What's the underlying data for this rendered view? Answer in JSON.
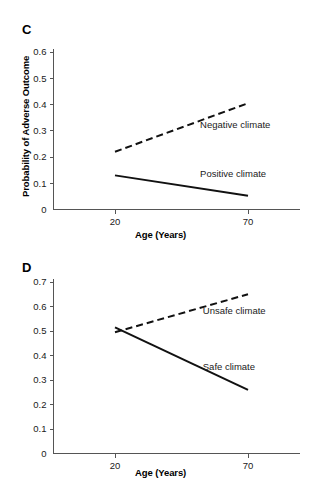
{
  "figure": {
    "panels": [
      {
        "letter": "C",
        "ylabel": "Probability of Adverse Outcome",
        "xlabel": "Age (Years)"
      },
      {
        "letter": "D",
        "ylabel": "Probability of Adverse Outcome",
        "xlabel": "Age (Years)"
      }
    ]
  },
  "chart_data": [
    {
      "type": "line",
      "panel": "C",
      "title": "",
      "xlabel": "Age (Years)",
      "ylabel": "Probability of Adverse Outcome",
      "x": [
        20,
        70
      ],
      "xticklabels": [
        "20",
        "70"
      ],
      "xlim": [
        13,
        82
      ],
      "ylim": [
        0,
        0.63
      ],
      "yticks": [
        0,
        0.1,
        0.2,
        0.3,
        0.4,
        0.5,
        0.6
      ],
      "yticklabels": [
        "0",
        "0.1",
        "0.2",
        "0.3",
        "0.4",
        "0.5",
        "0.6"
      ],
      "grid": false,
      "legend": "inline-annotation",
      "series": [
        {
          "name": "Negative climate",
          "style": "dashed",
          "values": [
            0.22,
            0.405
          ],
          "label_x": 52,
          "label_y": 0.325
        },
        {
          "name": "Positive climate",
          "style": "solid",
          "values": [
            0.13,
            0.052
          ],
          "label_x": 52,
          "label_y": 0.135
        }
      ]
    },
    {
      "type": "line",
      "panel": "D",
      "title": "",
      "xlabel": "Age (Years)",
      "ylabel": "Probability of Adverse Outcome",
      "x": [
        20,
        70
      ],
      "xticklabels": [
        "20",
        "70"
      ],
      "xlim": [
        13,
        82
      ],
      "ylim": [
        0,
        0.72
      ],
      "yticks": [
        0,
        0.1,
        0.2,
        0.3,
        0.4,
        0.5,
        0.6,
        0.7
      ],
      "yticklabels": [
        "0",
        "0.1",
        "0.2",
        "0.3",
        "0.4",
        "0.5",
        "0.6",
        "0.7"
      ],
      "grid": false,
      "legend": "inline-annotation",
      "series": [
        {
          "name": "Unsafe climate",
          "style": "dashed",
          "values": [
            0.495,
            0.65
          ],
          "label_x": 53,
          "label_y": 0.585
        },
        {
          "name": "Safe climate",
          "style": "solid",
          "values": [
            0.515,
            0.26
          ],
          "label_x": 53,
          "label_y": 0.355
        }
      ]
    }
  ],
  "colors": {
    "line": "#111111",
    "axis": "#555555",
    "text": "#1a1a1a",
    "background": "#ffffff"
  }
}
